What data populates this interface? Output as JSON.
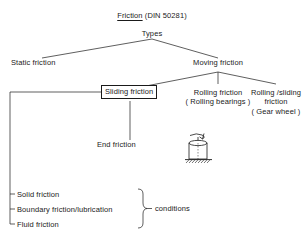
{
  "diagram": {
    "title_main": "Friction",
    "title_suffix": " (DIN 50281)",
    "root_label": "Types",
    "nodes": {
      "static_friction": "Static friction",
      "moving_friction": "Moving friction",
      "sliding_friction": "Sliding friction",
      "rolling_friction": "Rolling friction",
      "rolling_friction_note": "( Rolling bearings )",
      "rolling_sliding_friction_line1": "Rolling /sliding",
      "rolling_sliding_friction_line2": "friction",
      "rolling_sliding_friction_note": "( Gear wheel )",
      "end_friction": "End friction"
    },
    "conditions": {
      "items": [
        "Solid friction",
        "Boundary friction/lubrication",
        "Fluid friction"
      ],
      "brace_label": "conditions"
    },
    "icon": {
      "name": "rotating-cylinder-on-hatched-ground",
      "description": "cylinder resting on hatched ground with curved rotation arrow on top"
    },
    "colors": {
      "ink": "#1a1a1a",
      "background": "#ffffff"
    }
  }
}
